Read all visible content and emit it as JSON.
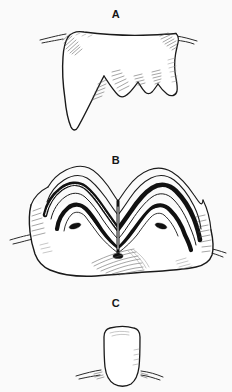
{
  "figure": {
    "background_color": "#fafafa",
    "ink_color": "#1a1a1a",
    "enamel_color": "#111111",
    "shading_color": "#5a5a5a",
    "width": 232,
    "height": 392,
    "style": "scientific pen-and-ink line drawing, black on white, no caption text"
  },
  "panels": [
    {
      "label": "A",
      "subject": "tooth crown, angular outline with one long pointed cusp at left and two short cusps at right",
      "icon": "tooth-crown-pointed-icon",
      "shading": "fine parallel hatching along upper-left shoulder, right flank and cusp edges",
      "gumline": "short broken strokes extending left and right from the crown base"
    },
    {
      "label": "B",
      "subject": "molar occlusal surface, nested W-shaped enamel ridges drawn as thick black bands over the crown",
      "icon": "molar-occlusal-zigzag-icon",
      "shading": "hatched shading across lower body and right flank",
      "gumline": "short broken strokes extending left and right from the crown base"
    },
    {
      "label": "C",
      "subject": "simple rounded crown, small tooth with smooth oval outline",
      "icon": "tooth-crown-rounded-icon",
      "shading": "faint highlight strokes at the crown apex",
      "gumline": "short broken strokes extending left and right from the crown base"
    }
  ]
}
